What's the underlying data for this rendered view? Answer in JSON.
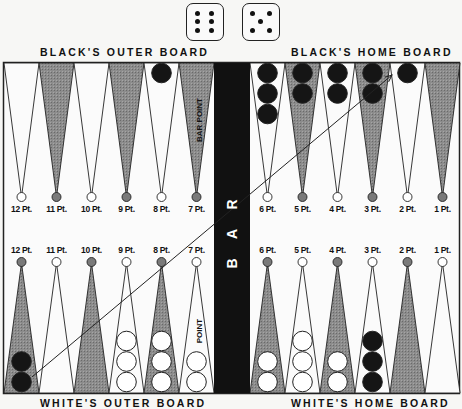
{
  "dice": [
    {
      "value": 6
    },
    {
      "value": 5
    }
  ],
  "labels": {
    "top_left": "BLACK'S OUTER BOARD",
    "top_right": "BLACK'S HOME BOARD",
    "bottom_left": "WHITE'S OUTER BOARD",
    "bottom_right": "WHITE'S HOME BOARD",
    "bar": "B A R",
    "bar_point_top": "BAR POINT",
    "bar_point_bottom": "POINT"
  },
  "top_points": [
    {
      "label": "12 Pt.",
      "color": "white",
      "checkers": 0,
      "checker_color": ""
    },
    {
      "label": "11 Pt.",
      "color": "gray",
      "checkers": 0,
      "checker_color": ""
    },
    {
      "label": "10 Pt.",
      "color": "white",
      "checkers": 0,
      "checker_color": ""
    },
    {
      "label": "9 Pt.",
      "color": "gray",
      "checkers": 0,
      "checker_color": ""
    },
    {
      "label": "8 Pt.",
      "color": "white",
      "checkers": 1,
      "checker_color": "black"
    },
    {
      "label": "7 Pt.",
      "color": "gray",
      "checkers": 0,
      "checker_color": ""
    },
    {
      "label": "6 Pt.",
      "color": "white",
      "checkers": 3,
      "checker_color": "black"
    },
    {
      "label": "5 Pt.",
      "color": "gray",
      "checkers": 2,
      "checker_color": "black"
    },
    {
      "label": "4 Pt.",
      "color": "white",
      "checkers": 2,
      "checker_color": "black"
    },
    {
      "label": "3 Pt.",
      "color": "gray",
      "checkers": 2,
      "checker_color": "black"
    },
    {
      "label": "2 Pt.",
      "color": "white",
      "checkers": 1,
      "checker_color": "black"
    },
    {
      "label": "1 Pt.",
      "color": "gray",
      "checkers": 0,
      "checker_color": ""
    }
  ],
  "bottom_points": [
    {
      "label": "12 Pt.",
      "color": "gray",
      "checkers": 2,
      "checker_color": "black"
    },
    {
      "label": "11 Pt.",
      "color": "white",
      "checkers": 0,
      "checker_color": ""
    },
    {
      "label": "10 Pt.",
      "color": "gray",
      "checkers": 0,
      "checker_color": ""
    },
    {
      "label": "9 Pt.",
      "color": "white",
      "checkers": 3,
      "checker_color": "white"
    },
    {
      "label": "8 Pt.",
      "color": "gray",
      "checkers": 3,
      "checker_color": "white"
    },
    {
      "label": "7 Pt.",
      "color": "white",
      "checkers": 2,
      "checker_color": "white"
    },
    {
      "label": "6 Pt.",
      "color": "gray",
      "checkers": 2,
      "checker_color": "white"
    },
    {
      "label": "5 Pt.",
      "color": "white",
      "checkers": 3,
      "checker_color": "white"
    },
    {
      "label": "4 Pt.",
      "color": "gray",
      "checkers": 2,
      "checker_color": "white"
    },
    {
      "label": "3 Pt.",
      "color": "white",
      "checkers": 3,
      "checker_color": "black"
    },
    {
      "label": "2 Pt.",
      "color": "gray",
      "checkers": 0,
      "checker_color": ""
    },
    {
      "label": "1 Pt.",
      "color": "white",
      "checkers": 0,
      "checker_color": ""
    }
  ],
  "move_arrow": {
    "from": "bottom 12 Pt.",
    "to": "top 2 Pt."
  },
  "colors": {
    "gray_point": "#8a8a8a",
    "bar": "#111111",
    "black_checker": "#151515",
    "frame": "#222222"
  }
}
